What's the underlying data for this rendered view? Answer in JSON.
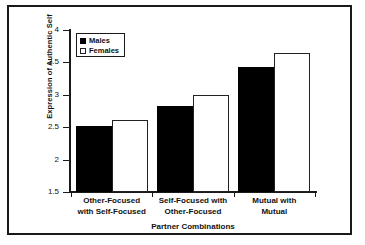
{
  "chart_data": {
    "type": "bar",
    "title": "",
    "xlabel": "Partner Combinations",
    "ylabel": "Expression of Authentic Self",
    "categories": [
      "Other-Focused with Self-Focused",
      "Self-Focused with Other-Focused",
      "Mutual with Mutual"
    ],
    "category_lines": [
      [
        "Other-Focused",
        "with Self-Focused"
      ],
      [
        "Self-Focused with",
        "Other-Focused"
      ],
      [
        "Mutual with",
        "Mutual"
      ]
    ],
    "series": [
      {
        "name": "Males",
        "values": [
          2.52,
          2.83,
          3.43
        ],
        "color": "#000000"
      },
      {
        "name": "Females",
        "values": [
          2.61,
          3.0,
          3.65
        ],
        "color": "#ffffff"
      }
    ],
    "ylim": [
      1.5,
      4
    ],
    "yticks": [
      1.5,
      2,
      2.5,
      3,
      3.5,
      4
    ],
    "ytick_labels": [
      "1.5",
      "2",
      "2.5",
      "3",
      "3.5",
      "4"
    ],
    "grid": false,
    "legend_position": "upper left",
    "legend_entries": [
      "Males",
      "Females"
    ]
  }
}
